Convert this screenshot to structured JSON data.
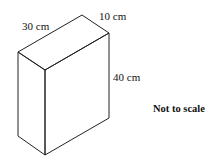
{
  "diagram": {
    "type": "cuboid",
    "labels": {
      "length": "30 cm",
      "depth": "10 cm",
      "height": "40 cm"
    },
    "note": "Not to scale",
    "line_color": "#222222"
  }
}
